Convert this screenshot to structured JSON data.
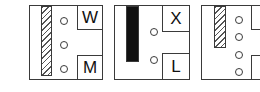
{
  "panels": [
    {
      "bar": "hatched",
      "dots": 3,
      "top_label": "W",
      "bottom_label": "M"
    },
    {
      "bar": "solid",
      "dots": 2,
      "top_label": "X",
      "bottom_label": "L"
    },
    {
      "bar": "hatched",
      "dots": 4,
      "top_label": "V",
      "bottom_label": "I"
    }
  ],
  "colors": {
    "stroke": "#3a3a3a",
    "solid_bar": "#111111",
    "background": "#ffffff"
  }
}
